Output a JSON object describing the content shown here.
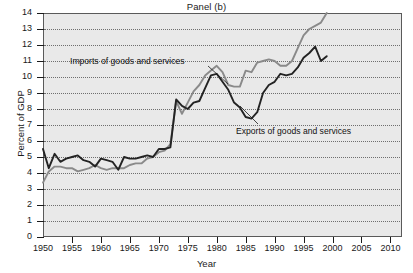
{
  "chart_data": {
    "type": "line",
    "title": "Panel (b)",
    "xlabel": "Year",
    "ylabel": "Percent of GDP",
    "xlim": [
      1950,
      2012
    ],
    "ylim": [
      0,
      14
    ],
    "grid": true,
    "legend_position": "inline-annotations",
    "xticks": [
      1950,
      1955,
      1960,
      1965,
      1970,
      1975,
      1980,
      1985,
      1990,
      1995,
      2000,
      2005,
      2010
    ],
    "yticks": [
      0,
      1,
      2,
      3,
      4,
      5,
      6,
      7,
      8,
      9,
      10,
      11,
      12,
      13,
      14
    ],
    "colors": {
      "imports": "#8a8a8a",
      "exports": "#232323",
      "plot_background": "#e9e9e9",
      "grid": "#6e6e6e",
      "axis": "#1a1a1a"
    },
    "annotations": [
      {
        "name": "imports-label",
        "text": "Imports of goods and services",
        "points_to_year": 1978
      },
      {
        "name": "exports-label",
        "text": "Exports of goods and services",
        "points_to_year": 1988
      }
    ],
    "x": [
      1950,
      1951,
      1952,
      1953,
      1954,
      1955,
      1956,
      1957,
      1958,
      1959,
      1960,
      1961,
      1962,
      1963,
      1964,
      1965,
      1966,
      1967,
      1968,
      1969,
      1970,
      1971,
      1972,
      1973,
      1974,
      1975,
      1976,
      1977,
      1978,
      1979,
      1980,
      1981,
      1982,
      1983,
      1984,
      1985,
      1986,
      1987,
      1988,
      1989,
      1990,
      1991,
      1992,
      1993,
      1994,
      1995,
      1996,
      1997,
      1998,
      1999
    ],
    "series": [
      {
        "name": "Exports of goods and services",
        "color": "#232323",
        "values": [
          5.5,
          4.3,
          5.2,
          4.7,
          4.9,
          5.0,
          5.1,
          4.8,
          4.7,
          4.4,
          4.9,
          4.8,
          4.7,
          4.2,
          5.0,
          4.9,
          4.9,
          5.0,
          5.1,
          5.0,
          5.5,
          5.5,
          5.6,
          8.6,
          8.2,
          8.0,
          8.4,
          8.5,
          9.3,
          10.1,
          10.2,
          9.7,
          9.2,
          8.4,
          8.1,
          7.5,
          7.4,
          7.8,
          9.0,
          9.5,
          9.7,
          10.2,
          10.1,
          10.2,
          10.6,
          11.2,
          11.5,
          11.9,
          11.0,
          11.3
        ],
        "series_color_label": "dark"
      },
      {
        "name": "Imports of goods and services",
        "color": "#8a8a8a",
        "values": [
          3.4,
          4.1,
          4.4,
          4.4,
          4.3,
          4.3,
          4.1,
          4.2,
          4.3,
          4.5,
          4.3,
          4.2,
          4.3,
          4.3,
          4.3,
          4.5,
          4.6,
          4.6,
          4.9,
          5.0,
          5.3,
          5.4,
          5.8,
          8.5,
          7.7,
          8.4,
          9.1,
          9.5,
          10.1,
          10.4,
          10.7,
          10.3,
          9.5,
          9.4,
          9.4,
          10.4,
          10.3,
          10.9,
          11.0,
          11.1,
          11.0,
          10.7,
          10.7,
          11.0,
          11.8,
          12.6,
          13.0,
          13.2,
          13.4,
          14.0
        ],
        "series_color_label": "gray"
      }
    ]
  },
  "figure": {
    "panel_title": "Panel (b)",
    "x_axis_title": "Year",
    "y_axis_title": "Percent of GDP"
  }
}
